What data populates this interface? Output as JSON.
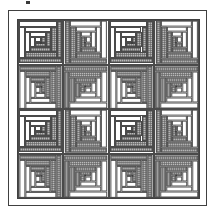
{
  "image": {
    "title": "Log Cabin quilt diagram",
    "description": "Line-art quilt pattern drawing: a framed 4x4 grid of log cabin blocks whose light and dark halves are rotated so each 2x2 group forms a cross / barn-raising motif.",
    "width": 215,
    "height": 214
  },
  "colors": {
    "ink": "#404040",
    "block_outline": "#4a4a4a",
    "light_fabric": "#ffffff",
    "dark_fabric": "#b9b9b9",
    "center_square": "#8a8a8a",
    "paper": "#ffffff"
  },
  "frame": {
    "style": "double rule",
    "outer_border_px": 1,
    "inner_border_px": 1
  },
  "quilt": {
    "name": "Log Cabin",
    "setting": "Barn Raising / Cross",
    "rows": 4,
    "columns": 4,
    "block_count": 16,
    "logs_per_block": 4,
    "center": "dark square",
    "blocks": [
      {
        "row": 1,
        "col": 1,
        "orientation": "dark-lower-right",
        "class": "o-tl"
      },
      {
        "row": 1,
        "col": 2,
        "orientation": "dark-lower-left",
        "class": "o-tr"
      },
      {
        "row": 1,
        "col": 3,
        "orientation": "dark-lower-right",
        "class": "o-tl"
      },
      {
        "row": 1,
        "col": 4,
        "orientation": "dark-lower-left",
        "class": "o-tr"
      },
      {
        "row": 2,
        "col": 1,
        "orientation": "dark-upper-right",
        "class": "o-bl"
      },
      {
        "row": 2,
        "col": 2,
        "orientation": "dark-upper-left",
        "class": "o-br"
      },
      {
        "row": 2,
        "col": 3,
        "orientation": "dark-upper-right",
        "class": "o-bl"
      },
      {
        "row": 2,
        "col": 4,
        "orientation": "dark-upper-left",
        "class": "o-br"
      },
      {
        "row": 3,
        "col": 1,
        "orientation": "dark-lower-right",
        "class": "o-tl"
      },
      {
        "row": 3,
        "col": 2,
        "orientation": "dark-lower-left",
        "class": "o-tr"
      },
      {
        "row": 3,
        "col": 3,
        "orientation": "dark-lower-right",
        "class": "o-tl"
      },
      {
        "row": 3,
        "col": 4,
        "orientation": "dark-lower-left",
        "class": "o-tr"
      },
      {
        "row": 4,
        "col": 1,
        "orientation": "dark-upper-right",
        "class": "o-bl"
      },
      {
        "row": 4,
        "col": 2,
        "orientation": "dark-upper-left",
        "class": "o-br"
      },
      {
        "row": 4,
        "col": 3,
        "orientation": "dark-upper-right",
        "class": "o-bl"
      },
      {
        "row": 4,
        "col": 4,
        "orientation": "dark-upper-left",
        "class": "o-br"
      }
    ]
  },
  "artifact": {
    "name": "scan-speck",
    "visible": true
  }
}
